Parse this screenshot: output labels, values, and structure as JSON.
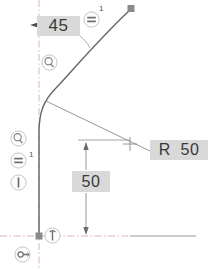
{
  "drawing": {
    "type": "cad-sketch",
    "title": "Tangent arc sketch with dimensions",
    "background_color": "#ffffff",
    "geometry_color": "#6b6b6b",
    "construction_color": "#c8a0a0",
    "label_background": "#d9d9d9",
    "label_text_color": "#3a3a3a"
  },
  "dimensions": [
    {
      "id": "angle",
      "value": "45",
      "kind": "angular",
      "position": {
        "x": 37,
        "y": 16
      }
    },
    {
      "id": "radius",
      "value": "R  50",
      "kind": "radial",
      "position": {
        "x": 150,
        "y": 140
      }
    },
    {
      "id": "length",
      "value": "50",
      "kind": "linear",
      "position": {
        "x": 72,
        "y": 171
      }
    }
  ],
  "tags": [
    {
      "id": "top-number",
      "value": "1",
      "position": {
        "x": 99,
        "y": 4
      }
    },
    {
      "id": "left-number",
      "value": "1",
      "position": {
        "x": 29,
        "y": 150
      }
    }
  ],
  "constraints": [
    {
      "id": "tangent-upper",
      "icon": "tangent-icon",
      "label": "Tangent"
    },
    {
      "id": "tangent-left",
      "icon": "tangent-icon",
      "label": "Tangent"
    },
    {
      "id": "equal-left",
      "icon": "equal-icon",
      "label": "Equal"
    },
    {
      "id": "vertical-left",
      "icon": "vertical-icon",
      "label": "Vertical"
    },
    {
      "id": "equal-top",
      "icon": "equal-icon",
      "label": "Equal"
    },
    {
      "id": "fix-origin",
      "icon": "fix-icon",
      "label": "Fix"
    },
    {
      "id": "anchor-origin",
      "icon": "anchor-icon",
      "label": "Anchor"
    }
  ],
  "points": [
    {
      "id": "endpoint-top",
      "shape": "square",
      "x": 131,
      "y": 8
    },
    {
      "id": "origin-point",
      "shape": "square",
      "x": 39,
      "y": 236
    },
    {
      "id": "arc-center",
      "shape": "cross",
      "x": 130,
      "y": 144
    }
  ]
}
